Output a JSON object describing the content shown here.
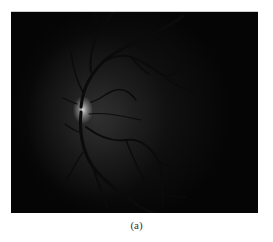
{
  "figure": {
    "caption": "(a)",
    "colors": {
      "background": "#050505",
      "optic_disc": "#dcdcdc",
      "vessel": "#0a0a0a"
    }
  }
}
